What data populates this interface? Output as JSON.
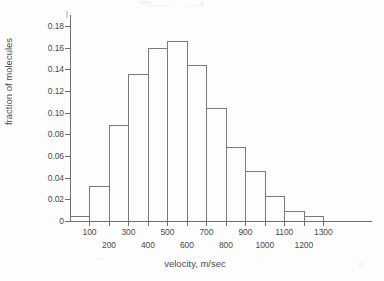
{
  "chart_data": {
    "type": "bar",
    "title": "",
    "xlabel": "velocity, m/sec",
    "ylabel": "fraction of molecules",
    "categories": [
      "0-100",
      "100-200",
      "200-300",
      "300-400",
      "400-500",
      "500-600",
      "600-700",
      "700-800",
      "800-900",
      "900-1000",
      "1000-1100",
      "1100-1200",
      "1200-1300"
    ],
    "bin_starts": [
      0,
      100,
      200,
      300,
      400,
      500,
      600,
      700,
      800,
      900,
      1000,
      1100,
      1200
    ],
    "bin_width": 100,
    "values": [
      0.005,
      0.032,
      0.089,
      0.136,
      0.16,
      0.166,
      0.144,
      0.104,
      0.068,
      0.046,
      0.023,
      0.009,
      0.005
    ],
    "xlim": [
      0,
      1550
    ],
    "ylim": [
      0,
      0.19
    ],
    "y_ticks": [
      0,
      0.02,
      0.04,
      0.06,
      0.08,
      0.1,
      0.12,
      0.14,
      0.16,
      0.18
    ],
    "y_tick_labels": [
      "0",
      "0.02",
      "0.04",
      "0.06",
      "0.08",
      "0.10",
      "0.12",
      "0.14",
      "0.16",
      "0.18"
    ],
    "x_ticks": [
      100,
      200,
      300,
      400,
      500,
      600,
      700,
      800,
      900,
      1000,
      1100,
      1200,
      1300
    ],
    "x_tick_labels": [
      "100",
      "200",
      "300",
      "400",
      "500",
      "600",
      "700",
      "800",
      "900",
      "1000",
      "1100",
      "1200",
      "1300"
    ],
    "x_tick_label_rows": [
      "top",
      "bottom",
      "top",
      "bottom",
      "top",
      "bottom",
      "top",
      "bottom",
      "top",
      "bottom",
      "top",
      "bottom",
      "top"
    ],
    "grid": false,
    "legend": null,
    "bar_edge_color": "#7a7a7c",
    "bar_fill_color": "transparent",
    "axis_color": "#6e6e70",
    "background_color": "#fdfdfd"
  }
}
